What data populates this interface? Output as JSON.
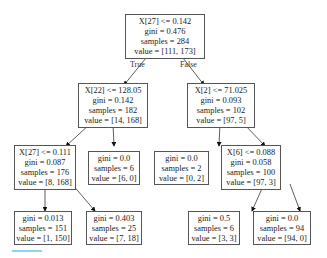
{
  "tree": {
    "nodes": [
      {
        "id": "n0",
        "lines": [
          "X[27] <= 0.142",
          "gini = 0.476",
          "samples = 284",
          "value = [111, 173]"
        ]
      },
      {
        "id": "n1",
        "lines": [
          "X[22] <= 128.05",
          "gini = 0.142",
          "samples = 182",
          "value = [14, 168]"
        ]
      },
      {
        "id": "n2",
        "lines": [
          "X[2] <= 71.025",
          "gini = 0.093",
          "samples = 102",
          "value = [97, 5]"
        ]
      },
      {
        "id": "n3",
        "lines": [
          "X[27] <= 0.111",
          "gini = 0.087",
          "samples = 176",
          "value = [8, 168]"
        ]
      },
      {
        "id": "n4",
        "lines": [
          "gini = 0.0",
          "samples = 6",
          "value = [6, 0]"
        ]
      },
      {
        "id": "n5",
        "lines": [
          "gini = 0.0",
          "samples = 2",
          "value = [0, 2]"
        ]
      },
      {
        "id": "n6",
        "lines": [
          "X[6] <= 0.088",
          "gini = 0.058",
          "samples = 100",
          "value = [97, 3]"
        ]
      },
      {
        "id": "n7",
        "lines": [
          "gini = 0.013",
          "samples = 151",
          "value = [1, 150]"
        ]
      },
      {
        "id": "n8",
        "lines": [
          "gini = 0.403",
          "samples = 25",
          "value = [7, 18]"
        ]
      },
      {
        "id": "n9",
        "lines": [
          "gini = 0.5",
          "samples = 6",
          "value = [3, 3]"
        ]
      },
      {
        "id": "n10",
        "lines": [
          "gini = 0.0",
          "samples = 94",
          "value = [94, 0]"
        ]
      }
    ],
    "edge_labels": {
      "true": "True",
      "false": "False"
    }
  },
  "colors": {
    "border": "#555555",
    "accent_bar": "#8fd3f0"
  }
}
